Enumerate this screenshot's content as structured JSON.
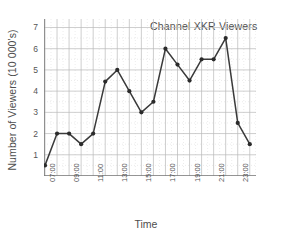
{
  "chart_data": {
    "type": "line",
    "title": "Channel XKR Viewers",
    "xlabel": "Time",
    "ylabel": "Number of Viewers (10 000's)",
    "x": [
      "07:00",
      "08:00",
      "09:00",
      "10:00",
      "11:00",
      "12:00",
      "13:00",
      "14:00",
      "15:00",
      "16:00",
      "17:00",
      "18:00",
      "19:00",
      "20:00",
      "21:00",
      "22:00",
      "23:00",
      "24:00"
    ],
    "values": [
      0.5,
      2.0,
      2.0,
      1.5,
      2.0,
      4.45,
      5.0,
      4.0,
      3.0,
      3.5,
      6.0,
      5.25,
      4.5,
      5.5,
      5.5,
      6.5,
      2.5,
      1.5
    ],
    "xtick_labels": [
      "07:00",
      "09:00",
      "11:00",
      "13:00",
      "15:00",
      "17:00",
      "19:00",
      "21:00",
      "23:00"
    ],
    "ytick_labels": [
      "1",
      "2",
      "3",
      "4",
      "5",
      "6",
      "7"
    ],
    "ylim": [
      0,
      7.4
    ],
    "xlim": [
      0,
      17
    ],
    "grid": true,
    "legend": "none",
    "line_color": "#3a3a3a",
    "marker_color": "#2b2b2b",
    "grid_color": "#b9b9b9",
    "minor_grid_color": "#d8d8d8",
    "axis_color": "#7a7a7a"
  }
}
